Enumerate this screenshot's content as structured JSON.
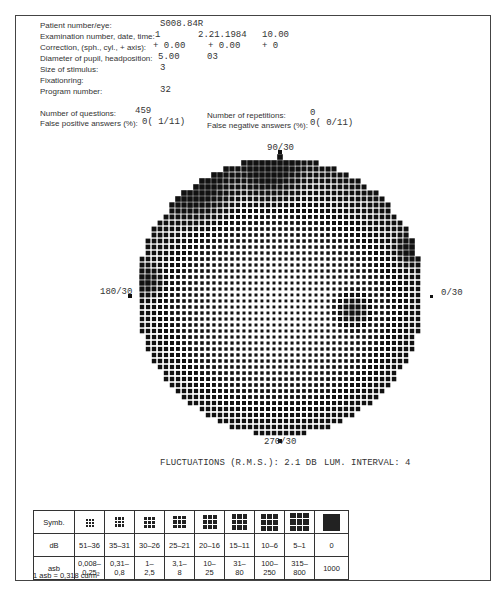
{
  "header": {
    "rows": [
      {
        "label": "Patient number/eye:",
        "values": [
          "S008.84R"
        ]
      },
      {
        "label": "Examination number, date, time:",
        "values": [
          "1",
          "2.21.1984",
          "10.00"
        ]
      },
      {
        "label": "Correction, (sph., cyl., + axis):",
        "values": [
          "+ 0.00",
          "+ 0.00",
          "+ 0"
        ]
      },
      {
        "label": "Diameter of pupil, headposition:",
        "values": [
          "5.00",
          "03"
        ]
      },
      {
        "label": "Size of stimulus:",
        "values": [
          "3"
        ]
      },
      {
        "label": "Fixationring:",
        "values": []
      },
      {
        "label": "Program number:",
        "values": [
          "32"
        ]
      }
    ],
    "questions_label": "Number of questions:",
    "questions_value": "459",
    "false_pos_label": "False positive answers (%):",
    "false_pos_value": "0( 1/11)",
    "repetitions_label": "Number of repetitions:",
    "repetitions_value": "0",
    "false_neg_label": "False negative answers (%):",
    "false_neg_value": "0( 0/11)"
  },
  "field": {
    "label_top": "90/30",
    "label_bottom": "270/30",
    "label_left": "180/30",
    "label_right": "0/30",
    "center": [
      280,
      296
    ],
    "radius_x": 144,
    "radius_y": 139,
    "pitch": 6,
    "blind_spot": [
      352,
      310
    ],
    "dark_regions": [
      [
        148,
        282,
        22
      ],
      [
        200,
        190,
        45
      ],
      [
        270,
        175,
        40
      ],
      [
        410,
        250,
        20
      ]
    ]
  },
  "stats": {
    "fluctuations": "FLUCTUATIONS (R.M.S.):  2.1 DB",
    "lum_interval": "LUM. INTERVAL: 4"
  },
  "legend": {
    "row_headers": [
      "Symb.",
      "dB",
      "asb"
    ],
    "symbols": [
      {
        "grid": 3,
        "size": 2
      },
      {
        "grid": 3,
        "size": 2.5
      },
      {
        "grid": 3,
        "size": 3
      },
      {
        "grid": 3,
        "size": 3.5
      },
      {
        "grid": 3,
        "size": 4
      },
      {
        "grid": 3,
        "size": 4.5
      },
      {
        "grid": 3,
        "size": 5
      },
      {
        "grid": 3,
        "size": 5.5
      },
      {
        "grid": 1,
        "size": 17
      }
    ],
    "db": [
      "51–36",
      "35–31",
      "30–26",
      "25–21",
      "20–16",
      "15–11",
      "10–6",
      "5–1",
      "0"
    ],
    "asb": [
      "0,008–\n0,25",
      "0,31–\n0,8",
      "1–\n2,5",
      "3,1–\n8",
      "10–\n25",
      "31–\n80",
      "100–\n250",
      "315–\n800",
      "1000"
    ],
    "note": "1 asb = 0,318 cd/m²"
  }
}
